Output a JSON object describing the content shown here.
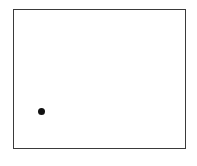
{
  "diagram": {
    "frame": {
      "left": 13,
      "top": 9,
      "right": 186,
      "bottom": 149,
      "border_color": "#3a3a3a"
    },
    "points": [
      {
        "x": 41.5,
        "y": 111,
        "diameter": 7,
        "color": "#111111"
      }
    ]
  }
}
